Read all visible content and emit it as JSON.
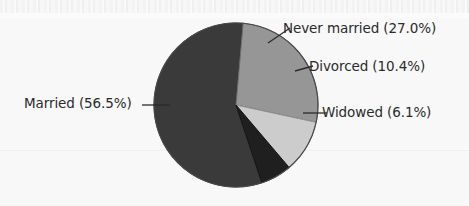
{
  "figure": {
    "background_color": "#f8f8f8",
    "text_color": "#2b2b2b",
    "leader_line_color": "#2b2b2b"
  },
  "chart_data": {
    "type": "pie",
    "title": "",
    "xlabel": "",
    "ylabel": "",
    "legend_position": "none",
    "grid": false,
    "labels_inline": true,
    "units": "percent",
    "total": 100.0,
    "categories": [
      "Never married",
      "Divorced",
      "Widowed",
      "Married"
    ],
    "values": [
      27.0,
      10.4,
      6.1,
      56.5
    ],
    "colors": [
      "#969696",
      "#cccccc",
      "#1f1f1f",
      "#3a3a3a"
    ],
    "slices": [
      {
        "name": "Never married",
        "value": 27.0,
        "label": "Never married (27.0%)",
        "color": "#969696",
        "start_angle_deg": 275.0,
        "end_angle_deg": 372.2
      },
      {
        "name": "Divorced",
        "value": 10.4,
        "label": "Divorced (10.4%)",
        "color": "#cccccc",
        "start_angle_deg": 372.2,
        "end_angle_deg": 409.6
      },
      {
        "name": "Widowed",
        "value": 6.1,
        "label": "Widowed (6.1%)",
        "color": "#1f1f1f",
        "start_angle_deg": 409.6,
        "end_angle_deg": 431.6
      },
      {
        "name": "Married",
        "value": 56.5,
        "label": "Married (56.5%)",
        "color": "#3a3a3a",
        "start_angle_deg": 431.6,
        "end_angle_deg": 635.0
      }
    ],
    "geometry": {
      "center_x": 236,
      "center_y": 105,
      "radius": 82
    }
  },
  "labels": {
    "never_married": "Never married (27.0%)",
    "divorced": "Divorced (10.4%)",
    "widowed": "Widowed (6.1%)",
    "married": "Married (56.5%)"
  }
}
